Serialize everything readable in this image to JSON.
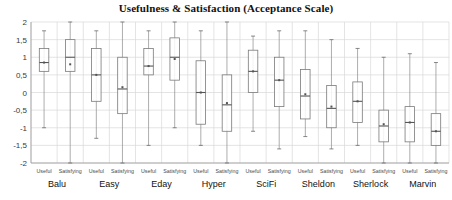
{
  "chart_data": {
    "type": "box",
    "title": "Usefulness & Satisfaction (Acceptance Scale)",
    "xlabel": "",
    "ylabel": "",
    "ylim": [
      -2,
      2
    ],
    "yticks": [
      2,
      1.5,
      1,
      0.5,
      0,
      -0.5,
      -1,
      -1.5,
      -2
    ],
    "ytick_labels": [
      "2",
      "1,5",
      "1",
      "0,5",
      "0",
      "-0,5",
      "-1",
      "-1,5",
      "-2"
    ],
    "grid": true,
    "legend": "none",
    "groups": [
      "Balu",
      "Easy",
      "Eday",
      "Hyper",
      "SciFi",
      "Sheldon",
      "Sherlock",
      "Marvin"
    ],
    "measures": [
      "Useful",
      "Satisfying"
    ],
    "categories": [
      "Balu Useful",
      "Balu Satisfying",
      "Easy Useful",
      "Easy Satisfying",
      "Eday Useful",
      "Eday Satisfying",
      "Hyper Useful",
      "Hyper Satisfying",
      "SciFi Useful",
      "SciFi Satisfying",
      "Sheldon Useful",
      "Sheldon Satisfying",
      "Sherlock Useful",
      "Sherlock Satisfying",
      "Marvin Useful",
      "Marvin Satisfying"
    ],
    "boxes": [
      {
        "group": "Balu",
        "measure": "Useful",
        "whisker_low": -1.0,
        "q1": 0.6,
        "median": 0.85,
        "q3": 1.25,
        "whisker_high": 1.75,
        "mean": 0.85
      },
      {
        "group": "Balu",
        "measure": "Satisfying",
        "whisker_low": -2.0,
        "q1": 0.6,
        "median": 1.0,
        "q3": 1.5,
        "whisker_high": 2.0,
        "mean": 0.8
      },
      {
        "group": "Easy",
        "measure": "Useful",
        "whisker_low": -1.3,
        "q1": -0.25,
        "median": 0.5,
        "q3": 1.25,
        "whisker_high": 1.75,
        "mean": 0.5
      },
      {
        "group": "Easy",
        "measure": "Satisfying",
        "whisker_low": -2.0,
        "q1": -0.6,
        "median": 0.1,
        "q3": 1.0,
        "whisker_high": 2.0,
        "mean": 0.15
      },
      {
        "group": "Eday",
        "measure": "Useful",
        "whisker_low": -1.5,
        "q1": 0.5,
        "median": 0.75,
        "q3": 1.25,
        "whisker_high": 1.75,
        "mean": 0.75
      },
      {
        "group": "Eday",
        "measure": "Satisfying",
        "whisker_low": -1.0,
        "q1": 0.35,
        "median": 1.0,
        "q3": 1.55,
        "whisker_high": 2.0,
        "mean": 0.95
      },
      {
        "group": "Hyper",
        "measure": "Useful",
        "whisker_low": -1.5,
        "q1": -0.9,
        "median": 0.0,
        "q3": 0.9,
        "whisker_high": 1.75,
        "mean": 0.0
      },
      {
        "group": "Hyper",
        "measure": "Satisfying",
        "whisker_low": -2.0,
        "q1": -1.1,
        "median": -0.35,
        "q3": 0.5,
        "whisker_high": 2.0,
        "mean": -0.3
      },
      {
        "group": "SciFi",
        "measure": "Useful",
        "whisker_low": -1.1,
        "q1": 0.0,
        "median": 0.6,
        "q3": 1.2,
        "whisker_high": 1.6,
        "mean": 0.6
      },
      {
        "group": "SciFi",
        "measure": "Satisfying",
        "whisker_low": -1.6,
        "q1": -0.4,
        "median": 0.35,
        "q3": 1.0,
        "whisker_high": 1.75,
        "mean": 0.35
      },
      {
        "group": "Sheldon",
        "measure": "Useful",
        "whisker_low": -1.25,
        "q1": -0.75,
        "median": -0.1,
        "q3": 0.65,
        "whisker_high": 1.75,
        "mean": -0.05
      },
      {
        "group": "Sheldon",
        "measure": "Satisfying",
        "whisker_low": -1.6,
        "q1": -1.0,
        "median": -0.45,
        "q3": 0.2,
        "whisker_high": 1.5,
        "mean": -0.4
      },
      {
        "group": "Sherlock",
        "measure": "Useful",
        "whisker_low": -1.5,
        "q1": -0.85,
        "median": -0.25,
        "q3": 0.3,
        "whisker_high": 1.25,
        "mean": -0.25
      },
      {
        "group": "Sherlock",
        "measure": "Satisfying",
        "whisker_low": -2.0,
        "q1": -1.4,
        "median": -0.95,
        "q3": -0.5,
        "whisker_high": 1.0,
        "mean": -0.9
      },
      {
        "group": "Marvin",
        "measure": "Useful",
        "whisker_low": -2.0,
        "q1": -1.4,
        "median": -0.85,
        "q3": -0.4,
        "whisker_high": 1.1,
        "mean": -0.85
      },
      {
        "group": "Marvin",
        "measure": "Satisfying",
        "whisker_low": -2.0,
        "q1": -1.5,
        "median": -1.1,
        "q3": -0.6,
        "whisker_high": 0.85,
        "mean": -1.1
      }
    ],
    "colors": {
      "box_stroke": "#7a7a7a",
      "box_fill": "#ffffff",
      "whisker": "#8a8a8a",
      "median": "#555555",
      "grid": "#d9d9d9",
      "axis": "#9a9a9a",
      "text": "#111111"
    }
  }
}
